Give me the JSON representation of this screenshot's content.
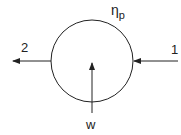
{
  "diagram": {
    "type": "pump-schematic",
    "efficiency_label": "η",
    "efficiency_subscript": "p",
    "inlet_label": "1",
    "outlet_label": "2",
    "work_label": "w",
    "stroke_color": "#222222"
  }
}
